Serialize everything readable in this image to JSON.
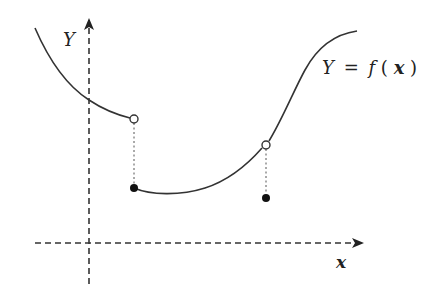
{
  "diagram": {
    "axes": {
      "x_label": "x",
      "y_label": "Y",
      "style": "dashed",
      "color": "#333333"
    },
    "function_label": {
      "lhs": "Y",
      "eq": "=",
      "f": "f",
      "open_paren": "(",
      "arg": "x",
      "close_paren": ")"
    },
    "curve_color": "#333333",
    "segments": [
      {
        "name": "left-branch",
        "from": [
          35,
          28
        ],
        "to": [
          130,
          118
        ]
      },
      {
        "name": "middle-branch",
        "from": [
          134,
          188
        ],
        "to": [
          262,
          148
        ]
      },
      {
        "name": "right-branch",
        "from": [
          269,
          141
        ],
        "to": [
          357,
          31
        ]
      }
    ],
    "discontinuities": [
      {
        "x": 134,
        "open_y": 119,
        "filled_y": 188
      },
      {
        "x": 266,
        "open_y": 145,
        "filled_y": 198
      }
    ]
  }
}
